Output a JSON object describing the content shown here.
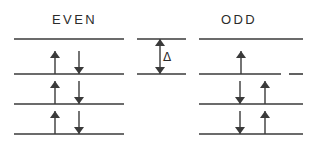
{
  "figure": {
    "width": 316,
    "height": 161,
    "background": "#ffffff",
    "ink_color": "#3a3a3a",
    "text_color": "#2b2b2b"
  },
  "panels": {
    "even": {
      "title": "EVEN",
      "title_x": 52,
      "title_y": 12,
      "line_x1": 14,
      "line_x2": 124,
      "levels": [
        {
          "name": "level-top",
          "y": 39,
          "arrows": []
        },
        {
          "name": "level-2",
          "y": 74,
          "arrows": [
            {
              "name": "spin-up-arrow",
              "direction": "up",
              "x": 55
            },
            {
              "name": "spin-down-arrow",
              "direction": "down",
              "x": 79
            }
          ]
        },
        {
          "name": "level-3",
          "y": 104,
          "arrows": [
            {
              "name": "spin-up-arrow",
              "direction": "up",
              "x": 55
            },
            {
              "name": "spin-down-arrow",
              "direction": "down",
              "x": 79
            }
          ]
        },
        {
          "name": "level-4",
          "y": 134,
          "arrows": [
            {
              "name": "spin-up-arrow",
              "direction": "up",
              "x": 55
            },
            {
              "name": "spin-down-arrow",
              "direction": "down",
              "x": 79
            }
          ]
        }
      ]
    },
    "odd": {
      "title": "ODD",
      "title_x": 221,
      "title_y": 12,
      "line_x1": 199,
      "line_x2": 303,
      "levels": [
        {
          "name": "level-top",
          "y": 39,
          "gap": null,
          "arrows": []
        },
        {
          "name": "level-2",
          "y": 74,
          "gap": {
            "x1": 281,
            "x2": 289
          },
          "arrows": [
            {
              "name": "spin-up-arrow",
              "direction": "up",
              "x": 241
            }
          ]
        },
        {
          "name": "level-3",
          "y": 104,
          "gap": null,
          "arrows": [
            {
              "name": "spin-down-arrow",
              "direction": "down",
              "x": 240
            },
            {
              "name": "spin-up-arrow",
              "direction": "up",
              "x": 265
            }
          ]
        },
        {
          "name": "level-4",
          "y": 134,
          "gap": null,
          "arrows": [
            {
              "name": "spin-down-arrow",
              "direction": "down",
              "x": 240
            },
            {
              "name": "spin-up-arrow",
              "direction": "up",
              "x": 265
            }
          ]
        }
      ]
    }
  },
  "gap_marker": {
    "label": "Δ",
    "label_x": 163,
    "label_y": 50,
    "line_x1": 137,
    "line_x2": 186,
    "top_y": 39,
    "bottom_y": 74,
    "arrow_x": 160
  },
  "geometry": {
    "level_line_width": 1.6,
    "arrow_length": 23,
    "arrow_head_width": 5,
    "arrow_head_length": 7,
    "arrow_shaft_width": 1.4
  }
}
